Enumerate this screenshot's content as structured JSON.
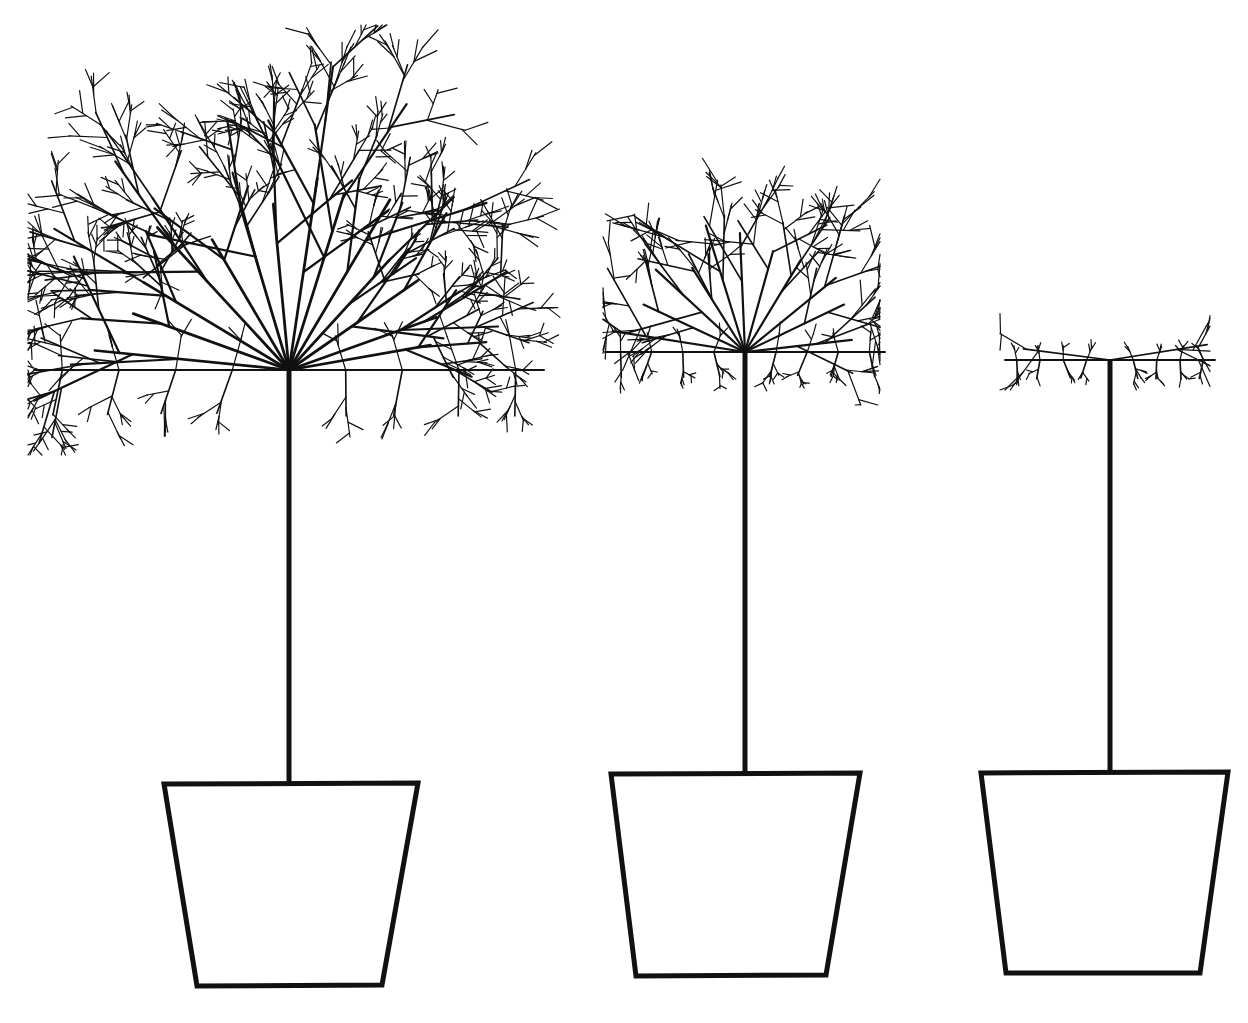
{
  "illustration": {
    "subject": "three potted standard trees at decreasing crown sizes",
    "background": "#ffffff",
    "stroke_color": "#111111",
    "trees": [
      {
        "id": "large",
        "crown_shape": "wide rounded-square crown",
        "trunk_x": 289
      },
      {
        "id": "medium",
        "crown_shape": "square crown",
        "trunk_x": 745
      },
      {
        "id": "small",
        "crown_shape": "sparse young crown",
        "trunk_x": 1110
      }
    ]
  }
}
